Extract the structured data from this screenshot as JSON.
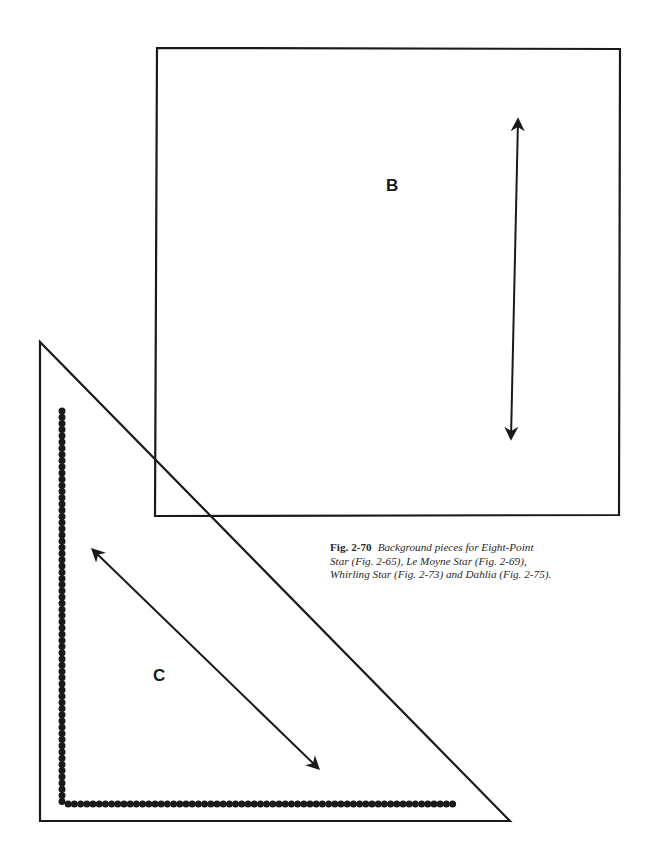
{
  "figure": {
    "number": "Fig. 2-70",
    "caption_lines": [
      "Background pieces for Eight-Point",
      "Star (Fig. 2-65), Le Moyne Star (Fig. 2-69),",
      "Whirling Star (Fig. 2-73) and Dahlia (Fig. 2-75)."
    ]
  },
  "pieces": {
    "square": {
      "label": "B",
      "shape": "square",
      "corners": [
        [
          157,
          48
        ],
        [
          620,
          49
        ],
        [
          619,
          515
        ],
        [
          155,
          516
        ]
      ],
      "grain_arrow": {
        "from": [
          518,
          120
        ],
        "to": [
          511,
          438
        ],
        "double_headed": true
      }
    },
    "triangle": {
      "label": "C",
      "shape": "right-triangle",
      "corners": [
        [
          40,
          342
        ],
        [
          40,
          821
        ],
        [
          510,
          821
        ]
      ],
      "grain_arrow": {
        "from": [
          93,
          550
        ],
        "to": [
          318,
          768
        ],
        "double_headed": true
      },
      "seam_dots": {
        "vertical": {
          "x": 62,
          "y_start": 411,
          "y_end": 804
        },
        "horizontal": {
          "y": 804,
          "x_start": 62,
          "x_end": 457
        },
        "dot_diameter": 7,
        "spacing": 6.2
      }
    }
  },
  "colors": {
    "line": "#1a1a1a",
    "background": "#ffffff"
  }
}
